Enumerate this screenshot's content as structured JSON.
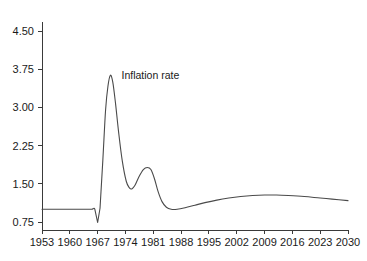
{
  "chart_data": {
    "type": "line",
    "title": "",
    "subtitle": "",
    "xlabel": "",
    "ylabel": "",
    "xlim": [
      1953,
      2030
    ],
    "ylim": [
      0.75,
      4.5
    ],
    "grid": false,
    "legend_position": "inline-annotation",
    "annotations": [
      {
        "text": "Inflation rate",
        "x": 1973,
        "y": 3.55
      }
    ],
    "x_tick_labels": [
      "1953",
      "1960",
      "1967",
      "1974",
      "1981",
      "1988",
      "1995",
      "2002",
      "2009",
      "2016",
      "2023",
      "2030"
    ],
    "x_tick_values": [
      1953,
      1960,
      1967,
      1974,
      1981,
      1988,
      1995,
      2002,
      2009,
      2016,
      2023,
      2030
    ],
    "y_tick_labels": [
      "4.50",
      "3.75",
      "3.00",
      "2.25",
      "1.50",
      "0.75"
    ],
    "y_tick_values": [
      4.5,
      3.75,
      3.0,
      2.25,
      1.5,
      0.75
    ],
    "series": [
      {
        "name": "Inflation rate",
        "color": "#4a4a4a",
        "x": [
          1953,
          1957,
          1961,
          1964,
          1965.5,
          1966.3,
          1967.0,
          1967.6,
          1968.3,
          1969.0,
          1969.6,
          1970.2,
          1970.8,
          1971.5,
          1972.3,
          1973.2,
          1974.2,
          1975.0,
          1975.6,
          1976.4,
          1977.4,
          1978.5,
          1979.5,
          1980.4,
          1981.3,
          1982.2,
          1983.2,
          1984.3,
          1985.5,
          1987.0,
          1989.0,
          1991.5,
          1994.0,
          1997.0,
          2000.0,
          2003.0,
          2006.0,
          2009.0,
          2012.0,
          2015.0,
          2019.0,
          2023.0,
          2026.0,
          2030.0
        ],
        "y": [
          1.0,
          1.0,
          1.0,
          1.0,
          1.0,
          1.0,
          0.74,
          1.02,
          1.95,
          2.95,
          3.42,
          3.63,
          3.5,
          3.08,
          2.5,
          1.95,
          1.55,
          1.42,
          1.4,
          1.47,
          1.64,
          1.78,
          1.82,
          1.78,
          1.6,
          1.35,
          1.15,
          1.04,
          1.0,
          1.0,
          1.03,
          1.08,
          1.13,
          1.18,
          1.22,
          1.25,
          1.27,
          1.28,
          1.28,
          1.27,
          1.25,
          1.22,
          1.2,
          1.17
        ]
      }
    ]
  },
  "axes": {
    "y_axis_name": "value-axis",
    "x_axis_name": "year-axis"
  }
}
